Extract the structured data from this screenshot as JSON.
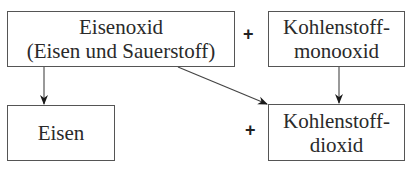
{
  "diagram": {
    "nodes": [
      {
        "id": "eisenoxid",
        "lines": [
          "Eisenoxid",
          "(Eisen und Sauerstoff)"
        ]
      },
      {
        "id": "kohlenstoffmonooxid",
        "lines": [
          "Kohlenstoff-",
          "monooxid"
        ]
      },
      {
        "id": "eisen",
        "lines": [
          "Eisen"
        ]
      },
      {
        "id": "kohlenstoffdioxid",
        "lines": [
          "Kohlenstoff-",
          "dioxid"
        ]
      }
    ],
    "operators": {
      "top_plus": "+",
      "bottom_plus": "+"
    },
    "edges": [
      {
        "from": "eisenoxid",
        "to": "eisen"
      },
      {
        "from": "eisenoxid",
        "to": "kohlenstoffdioxid"
      },
      {
        "from": "kohlenstoffmonooxid",
        "to": "kohlenstoffdioxid"
      }
    ],
    "colors": {
      "line": "#555555",
      "arrow": "#1a1a1a",
      "text": "#2a2a2a"
    }
  }
}
